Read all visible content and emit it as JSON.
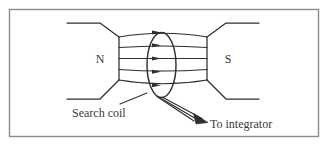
{
  "figure": {
    "name": "search-coil-between-magnet-poles",
    "background_color": "#ffffff",
    "border_color": "#8c8c8c",
    "line_color": "#2f2f2f",
    "text_color": "#3a3a3a",
    "labels": {
      "north_pole": "N",
      "south_pole": "S",
      "search_coil": "Search coil",
      "to_integrator": "To integrator"
    },
    "elements": {
      "field_line_count": 5,
      "lead_wire_count": 3,
      "field_direction": "left-to-right (N to S)"
    }
  }
}
